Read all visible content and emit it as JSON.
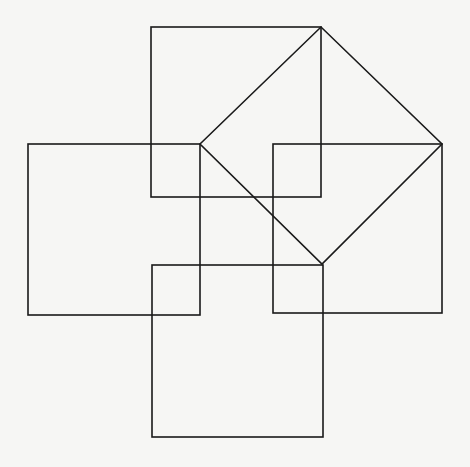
{
  "diagram": {
    "background": "#f6f6f4",
    "stroke": "#1a1a1a",
    "stroke_width": 1.6,
    "squares": [
      {
        "name": "top-square",
        "x": 151,
        "y": 27,
        "w": 170,
        "h": 170
      },
      {
        "name": "left-square",
        "x": 28,
        "y": 144,
        "w": 172,
        "h": 171
      },
      {
        "name": "right-square",
        "x": 273,
        "y": 144,
        "w": 169,
        "h": 169
      },
      {
        "name": "bottom-square",
        "x": 152,
        "y": 265,
        "w": 171,
        "h": 172
      }
    ],
    "tilted_square": {
      "name": "diamond",
      "points": [
        [
          200,
          144
        ],
        [
          321,
          27
        ],
        [
          442,
          144
        ],
        [
          322,
          264
        ]
      ]
    }
  }
}
